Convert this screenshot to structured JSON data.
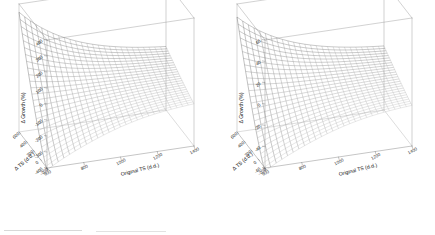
{
  "figure": {
    "title": "",
    "panel_count": 2,
    "background": "#ffffff",
    "line_color": "#333333",
    "frame_color": "#9a9a9a"
  },
  "chart_data": [
    {
      "type": "surface",
      "panel": "left",
      "title": "",
      "xlabel": "Original TS (d.d.)",
      "ylabel": "Δ TS (d.d.)",
      "zlabel": "Δ Growth (%)",
      "xticks": [
        600,
        800,
        1000,
        1200,
        1400
      ],
      "yticks": [
        -200,
        0,
        200,
        400,
        600
      ],
      "zticks": [
        -400,
        -300,
        -200,
        -100,
        0,
        100,
        200,
        300,
        400
      ],
      "xlim": [
        600,
        1400
      ],
      "ylim": [
        -200,
        600
      ],
      "zlim": [
        -400,
        400
      ],
      "grid": true,
      "legend": "none",
      "mesh_nx": 26,
      "mesh_ny": 26,
      "description": "Wireframe saddle response surface: high positive Δ Growth (~350%) at low Original TS and high Δ TS; deep negative trough (~-380%) near low Original TS and low Δ TS; flattening toward zero at high Original TS.",
      "surface_z_corners": {
        "x_min_y_min": -380,
        "x_min_y_max": 350,
        "x_max_y_min": -110,
        "x_max_y_max": -40
      }
    },
    {
      "type": "surface",
      "panel": "right",
      "title": "",
      "xlabel": "Original TS (d.d.)",
      "ylabel": "Δ TS (d.d.)",
      "zlabel": "Δ Growth (%)",
      "xticks": [
        600,
        800,
        1000,
        1200,
        1400
      ],
      "yticks": [
        -200,
        0,
        200,
        400,
        600
      ],
      "zticks": [
        -60,
        -40,
        -20,
        0,
        20,
        40,
        60
      ],
      "xlim": [
        600,
        1400
      ],
      "ylim": [
        -200,
        600
      ],
      "zlim": [
        -60,
        60
      ],
      "grid": true,
      "legend": "none",
      "mesh_nx": 26,
      "mesh_ny": 26,
      "description": "Wireframe saddle response surface: peak Δ Growth (~48%) at low Original TS and high Δ TS; trough (~-58%) at low Original TS and low Δ TS; surface levels toward -10% at high Original TS.",
      "surface_z_corners": {
        "x_min_y_min": -58,
        "x_min_y_max": 48,
        "x_max_y_min": -18,
        "x_max_y_max": -5
      }
    }
  ],
  "panels": [
    {
      "id": "left",
      "zlabel": "Δ Growth (%)",
      "xlabel": "Original TS (d.d.)",
      "ylabel": "Δ TS (d.d.)",
      "zticks": [
        "400",
        "300",
        "200",
        "100",
        "0",
        "-100",
        "-200",
        "-300",
        "-400"
      ],
      "xticks": [
        "600",
        "800",
        "1000",
        "1200",
        "1400"
      ],
      "yticks": [
        "600",
        "400",
        "200",
        "0",
        "-200"
      ]
    },
    {
      "id": "right",
      "zlabel": "Δ Growth (%)",
      "xlabel": "Original TS (d.d.)",
      "ylabel": "Δ TS (d.d.)",
      "zticks": [
        "60",
        "40",
        "20",
        "0",
        "-20",
        "-40",
        "-60"
      ],
      "xticks": [
        "600",
        "800",
        "1000",
        "1200",
        "1400"
      ],
      "yticks": [
        "600",
        "400",
        "200",
        "0",
        "-200"
      ]
    }
  ]
}
